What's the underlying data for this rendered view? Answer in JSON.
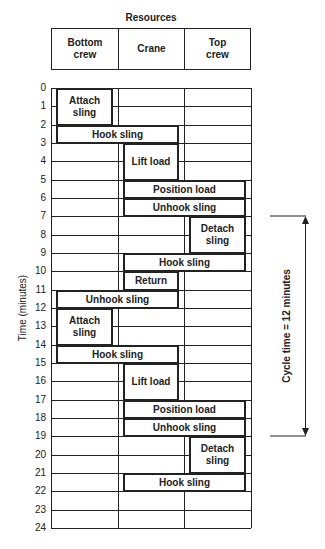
{
  "diagram": {
    "title": "Resources",
    "columns": [
      {
        "key": "bottom",
        "label": "Bottom\ncrew"
      },
      {
        "key": "crane",
        "label": "Crane"
      },
      {
        "key": "top",
        "label": "Top\ncrew"
      }
    ],
    "y_axis_label": "Time (minutes)",
    "y_ticks": [
      "0",
      "1",
      "2",
      "3",
      "4",
      "5",
      "6",
      "7",
      "8",
      "9",
      "10",
      "11",
      "12",
      "13",
      "14",
      "15",
      "16",
      "17",
      "18",
      "19",
      "20",
      "21",
      "22",
      "23",
      "24"
    ],
    "tasks": [
      {
        "label": "Attach\nsling",
        "start": 0,
        "end": 2,
        "from_col": 0,
        "to_col": 0
      },
      {
        "label": "Hook sling",
        "start": 2,
        "end": 3,
        "from_col": 0,
        "to_col": 1
      },
      {
        "label": "Lift load",
        "start": 3,
        "end": 5,
        "from_col": 1,
        "to_col": 1
      },
      {
        "label": "Position load",
        "start": 5,
        "end": 6,
        "from_col": 1,
        "to_col": 2
      },
      {
        "label": "Unhook sling",
        "start": 6,
        "end": 7,
        "from_col": 1,
        "to_col": 2
      },
      {
        "label": "Detach\nsling",
        "start": 7,
        "end": 9,
        "from_col": 2,
        "to_col": 2
      },
      {
        "label": "Hook sling",
        "start": 9,
        "end": 10,
        "from_col": 1,
        "to_col": 2
      },
      {
        "label": "Return",
        "start": 10,
        "end": 11,
        "from_col": 1,
        "to_col": 1
      },
      {
        "label": "Unhook sling",
        "start": 11,
        "end": 12,
        "from_col": 0,
        "to_col": 1
      },
      {
        "label": "Attach\nsling",
        "start": 12,
        "end": 14,
        "from_col": 0,
        "to_col": 0
      },
      {
        "label": "Hook sling",
        "start": 14,
        "end": 15,
        "from_col": 0,
        "to_col": 1
      },
      {
        "label": "Lift load",
        "start": 15,
        "end": 17,
        "from_col": 1,
        "to_col": 1
      },
      {
        "label": "Position load",
        "start": 17,
        "end": 18,
        "from_col": 1,
        "to_col": 2
      },
      {
        "label": "Unhook sling",
        "start": 18,
        "end": 19,
        "from_col": 1,
        "to_col": 2
      },
      {
        "label": "Detach\nsling",
        "start": 19,
        "end": 21,
        "from_col": 2,
        "to_col": 2
      },
      {
        "label": "Hook sling",
        "start": 21,
        "end": 22,
        "from_col": 1,
        "to_col": 2
      }
    ],
    "cycle": {
      "label": "Cycle time = 12 minutes",
      "start": 7,
      "end": 19
    }
  }
}
